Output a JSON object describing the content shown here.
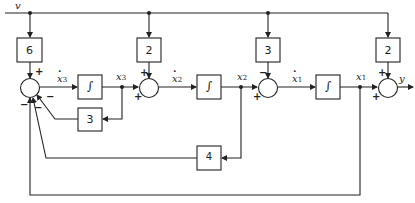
{
  "input_label": "v",
  "output_label": "y",
  "gains": {
    "input_to_sum1": "6",
    "input_to_sum2": "2",
    "input_to_sum3": "3",
    "input_to_output": "2",
    "feedback_x3": "3",
    "feedback_x2": "4"
  },
  "integrator_symbol": "∫",
  "signals": {
    "x3dot": {
      "base": "x",
      "sub": "3"
    },
    "x3": {
      "base": "x",
      "sub": "3"
    },
    "x2dot": {
      "base": "x",
      "sub": "2"
    },
    "x2": {
      "base": "x",
      "sub": "2"
    },
    "x1dot": {
      "base": "x",
      "sub": "1"
    },
    "x1": {
      "base": "x",
      "sub": "1"
    }
  },
  "signs": {
    "sum1_top": "+",
    "sum1_x3_feedback": "−",
    "sum1_x2_feedback": "−",
    "sum1_x1_feedback": "−",
    "sum2_top": "+",
    "sum2_left": "+",
    "sum3_top": "−",
    "sum3_left": "+",
    "sum4_top": "+",
    "sum4_left": "+"
  }
}
